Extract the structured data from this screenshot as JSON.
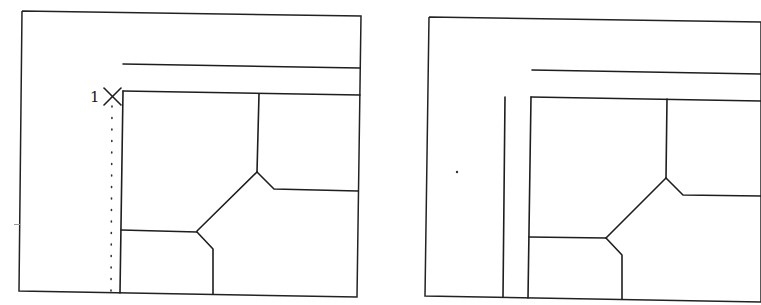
{
  "figure": {
    "line_color": "#1e1e1e",
    "background": "#ffffff"
  },
  "panels": [
    {
      "id": "before",
      "frame": {
        "points": "22,11 361,16 357,297 19,291 22,11"
      },
      "marker": {
        "label": "1",
        "x": 112,
        "y": 97,
        "glyph": "x-cross-marker"
      },
      "dotted_guide": {
        "x1": 112,
        "y1": 106,
        "x2": 111,
        "y2": 291
      },
      "lines": [
        {
          "name": "outer-wall-line",
          "points": "123,64 360,68"
        },
        {
          "name": "inner-rect-top",
          "points": "123,91 360,95"
        },
        {
          "name": "inner-rect-left",
          "points": "123,91 120,293"
        },
        {
          "name": "upper-divider",
          "points": "259,94 257,172"
        },
        {
          "name": "right-branch",
          "points": "257,172 274,189 358,191"
        },
        {
          "name": "diagonal-branch",
          "points": "257,172 197,231"
        },
        {
          "name": "left-branch",
          "points": "121,230 197,232"
        },
        {
          "name": "lower-branch",
          "points": "197,232 213,249 213,294"
        }
      ]
    },
    {
      "id": "after",
      "frame": {
        "points": "429,17 761,22 761,302 425,296 429,17"
      },
      "specks": [
        {
          "x": 457,
          "y": 172
        }
      ],
      "lines": [
        {
          "name": "outer-wall-line",
          "points": "532,70 761,74"
        },
        {
          "name": "offset-vertical-line",
          "points": "505,97 503,297"
        },
        {
          "name": "inner-rect-top",
          "points": "531,97 761,101"
        },
        {
          "name": "inner-rect-left",
          "points": "531,97 528,298"
        },
        {
          "name": "upper-divider",
          "points": "667,99 666,178"
        },
        {
          "name": "right-branch",
          "points": "666,178 683,195 761,196"
        },
        {
          "name": "diagonal-branch",
          "points": "666,178 606,238"
        },
        {
          "name": "left-branch",
          "points": "529,237 606,238"
        },
        {
          "name": "lower-branch",
          "points": "606,238 622,255 622,299"
        }
      ]
    }
  ],
  "stray_marks": [
    {
      "x": 14,
      "y": 224,
      "w": 6,
      "h": 1
    }
  ]
}
